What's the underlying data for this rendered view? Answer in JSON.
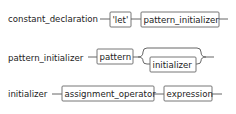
{
  "diagram": {
    "rules": [
      {
        "name": "constant_declaration",
        "sequence": [
          {
            "type": "terminal",
            "text": "'let'"
          },
          {
            "type": "nonterminal",
            "text": "pattern_initializer"
          }
        ]
      },
      {
        "name": "pattern_initializer",
        "sequence": [
          {
            "type": "nonterminal",
            "text": "pattern"
          },
          {
            "type": "optional",
            "text": "initializer"
          }
        ]
      },
      {
        "name": "initializer",
        "sequence": [
          {
            "type": "nonterminal",
            "text": "assignment_operator"
          },
          {
            "type": "nonterminal",
            "text": "expression"
          }
        ]
      }
    ],
    "colors": {
      "line": "#555555",
      "box_border": "#666666",
      "text": "#222222",
      "background": "#ffffff"
    }
  }
}
